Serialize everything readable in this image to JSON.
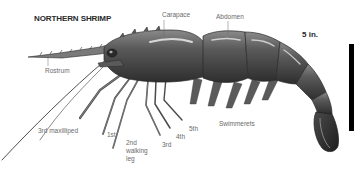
{
  "title": "NORTHERN SHRIMP",
  "scale": {
    "label": "5 in.",
    "bar_color": "#000000"
  },
  "labels": {
    "carapace": "Carapace",
    "abdomen": "Abdomen",
    "rostrum": "Rostrum",
    "third_maxilliped": "3rd maxilliped",
    "first": "1st",
    "second_walking_leg_line1": "2nd",
    "second_walking_leg_line2": "walking",
    "second_walking_leg_line3": "leg",
    "third": "3rd",
    "fourth": "4th",
    "fifth": "5th",
    "swimmerets": "Swimmerets"
  },
  "colors": {
    "background": "#ffffff",
    "body_dark": "#3a3a3a",
    "body_mid": "#6e6e6e",
    "body_light": "#a8a8a8",
    "label_text": "#6a6a6a",
    "title_text": "#2a2a2a"
  }
}
